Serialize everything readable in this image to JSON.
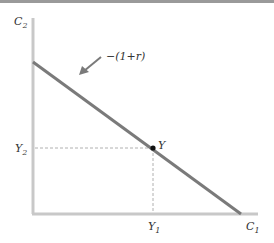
{
  "diagram": {
    "type": "intertemporal-budget-constraint",
    "axes": {
      "y_label": "C",
      "y_label_sub": "2",
      "x_label": "C",
      "x_label_sub": "1"
    },
    "budget_line": {
      "slope_label": "−(1+r)",
      "color": "#7a7a7a"
    },
    "point": {
      "label": "Y",
      "x_tick_label": "Y",
      "x_tick_sub": "1",
      "y_tick_label": "Y",
      "y_tick_sub": "2"
    },
    "colors": {
      "axis": "#c8c8c8",
      "line": "#7a7a7a",
      "guide": "#b0b0b0",
      "point": "#111111",
      "top_bar": "#9a9a9a"
    }
  }
}
